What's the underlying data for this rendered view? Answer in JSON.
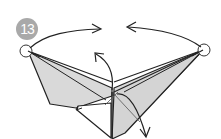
{
  "step": {
    "number": "13"
  },
  "colors": {
    "badge_bg": "#a9a9a9",
    "badge_text": "#ffffff",
    "paper_fill": "#d9d9d9",
    "line": "#222222",
    "pivot_circle": "#ffffff"
  },
  "diagram": {
    "arrows": [
      "left-tip-arrow-right",
      "right-tip-arrow-left",
      "center-arrow-up",
      "lower-arrow-down-right"
    ],
    "pivot_points": [
      "left-wing-tip",
      "right-wing-tip"
    ]
  }
}
